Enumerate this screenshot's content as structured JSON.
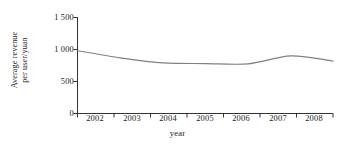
{
  "chart_data": {
    "type": "line",
    "title": "",
    "xlabel": "year",
    "ylabel_line1": "Average revenue",
    "ylabel_line2": "per user/yuan",
    "ylabel": "Average revenue per user/yuan",
    "x": [
      2002,
      2003,
      2004,
      2005,
      2006,
      2007,
      2008
    ],
    "categories": [
      "2002",
      "2003",
      "2004",
      "2005",
      "2006",
      "2007",
      "2008"
    ],
    "values": [
      980,
      870,
      790,
      780,
      775,
      900,
      820
    ],
    "series": [
      {
        "name": "Average revenue per user",
        "values": [
          980,
          870,
          790,
          780,
          775,
          900,
          820
        ]
      }
    ],
    "xtick_labels": [
      "2002",
      "2003",
      "2004",
      "2005",
      "2006",
      "2007",
      "2008"
    ],
    "ytick_labels": [
      "0",
      "500",
      "1 000",
      "1 500"
    ],
    "ytick_values": [
      0,
      500,
      1000,
      1500
    ],
    "ylim": [
      0,
      1500
    ],
    "xlim": [
      2002,
      2008
    ],
    "grid": false,
    "legend": false,
    "legend_position": "none",
    "line_color": "#808080",
    "axis_color": "#333333",
    "background_color": "#ffffff"
  }
}
